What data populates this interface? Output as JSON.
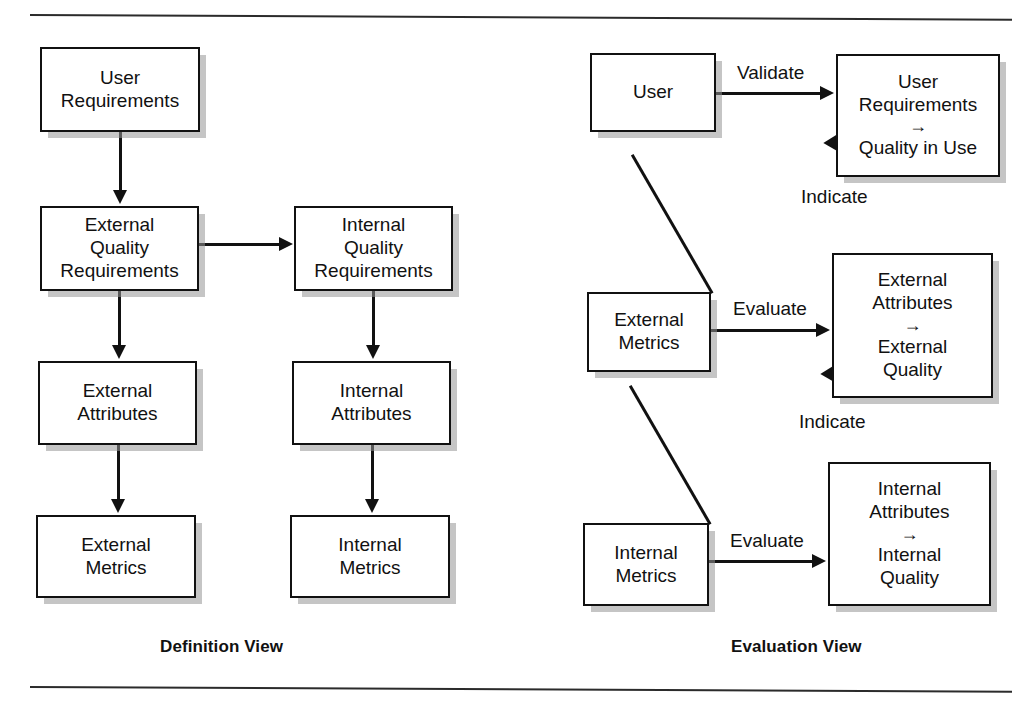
{
  "figure": {
    "definition_view": {
      "caption": "Definition View",
      "nodes": [
        {
          "id": "user-requirements",
          "lines": [
            "User",
            "Requirements"
          ]
        },
        {
          "id": "external-quality-requirements",
          "lines": [
            "External",
            "Quality",
            "Requirements"
          ]
        },
        {
          "id": "internal-quality-requirements",
          "lines": [
            "Internal",
            "Quality",
            "Requirements"
          ]
        },
        {
          "id": "external-attributes",
          "lines": [
            "External",
            "Attributes"
          ]
        },
        {
          "id": "internal-attributes",
          "lines": [
            "Internal",
            "Attributes"
          ]
        },
        {
          "id": "external-metrics",
          "lines": [
            "External",
            "Metrics"
          ]
        },
        {
          "id": "internal-metrics",
          "lines": [
            "Internal",
            "Metrics"
          ]
        }
      ]
    },
    "evaluation_view": {
      "caption": "Evaluation View",
      "nodes": [
        {
          "id": "user",
          "lines": [
            "User"
          ]
        },
        {
          "id": "user-req-quality-use",
          "lines": [
            "User",
            "Requirements"
          ],
          "arrow": "→",
          "lines_after": [
            "Quality in Use"
          ]
        },
        {
          "id": "eval-external-metrics",
          "lines": [
            "External",
            "Metrics"
          ]
        },
        {
          "id": "external-attr-quality",
          "lines": [
            "External",
            "Attributes"
          ],
          "arrow": "→",
          "lines_after": [
            "External",
            "Quality"
          ]
        },
        {
          "id": "eval-internal-metrics",
          "lines": [
            "Internal",
            "Metrics"
          ]
        },
        {
          "id": "internal-attr-quality",
          "lines": [
            "Internal",
            "Attributes"
          ],
          "arrow": "→",
          "lines_after": [
            "Internal",
            "Quality"
          ]
        }
      ],
      "edge_labels": {
        "validate": "Validate",
        "indicate_upper": "Indicate",
        "evaluate_external": "Evaluate",
        "indicate_lower": "Indicate",
        "evaluate_internal": "Evaluate"
      }
    }
  },
  "colors": {
    "line": "#111111",
    "box_fill": "#ffffff",
    "shadow": "#969696",
    "page_bg": "#ffffff"
  }
}
